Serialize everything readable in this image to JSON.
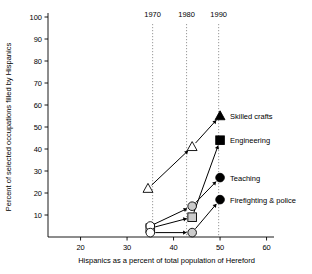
{
  "chart_data": {
    "type": "line",
    "title": "",
    "xlabel": "Hispanics as a percent of total population of Hereford",
    "ylabel": "Percent of selected occupations filled by Hispanics",
    "xlim": [
      13,
      62
    ],
    "ylim": [
      0,
      100
    ],
    "xticks": [
      20,
      30,
      40,
      50,
      60
    ],
    "xtick_labels": [
      "20",
      "30",
      "40",
      "50",
      "60"
    ],
    "yticks": [
      10,
      20,
      30,
      40,
      50,
      60,
      70,
      80,
      90,
      100
    ],
    "ytick_labels": [
      "10",
      "20",
      "30",
      "40",
      "50",
      "60",
      "70",
      "80",
      "90",
      "100"
    ],
    "grid": false,
    "legend_position": "inside-right",
    "year_markers": [
      {
        "label": "1970",
        "x": 35.5
      },
      {
        "label": "1980",
        "x": 42.8
      },
      {
        "label": "1990",
        "x": 49.7
      }
    ],
    "series": [
      {
        "name": "Skilled crafts",
        "marker": "triangle",
        "x": [
          34.5,
          44.0,
          50.0
        ],
        "values": [
          22,
          41,
          55
        ],
        "marker_fill": [
          "open",
          "open",
          "solid"
        ]
      },
      {
        "name": "Engineering",
        "marker": "square",
        "x": [
          35.0,
          44.0,
          50.0
        ],
        "values": [
          4,
          9,
          44
        ],
        "marker_fill": [
          "open",
          "grey",
          "solid"
        ]
      },
      {
        "name": "Teaching",
        "marker": "circle",
        "x": [
          35.0,
          44.0,
          50.0
        ],
        "values": [
          5,
          14,
          27
        ],
        "marker_fill": [
          "open",
          "grey",
          "solid"
        ]
      },
      {
        "name": "Firefighting & police",
        "marker": "circle",
        "x": [
          35.0,
          44.0,
          50.0
        ],
        "values": [
          2,
          2,
          17
        ],
        "marker_fill": [
          "open",
          "grey",
          "solid"
        ]
      }
    ],
    "legend_entries": [
      {
        "label": "Skilled crafts",
        "marker": "triangle",
        "x": 50.0,
        "y": 55
      },
      {
        "label": "Engineering",
        "marker": "square",
        "x": 50.0,
        "y": 44
      },
      {
        "label": "Teaching",
        "marker": "circle",
        "x": 50.0,
        "y": 27
      },
      {
        "label": "Firefighting & police",
        "marker": "circle",
        "x": 50.0,
        "y": 17
      }
    ]
  },
  "axes": {
    "x_title": "Hispanics as a percent of total population of Hereford",
    "y_title": "Percent of selected occupations filled by Hispanics",
    "x_ticks": [
      "20",
      "30",
      "40",
      "50",
      "60"
    ],
    "y_ticks": [
      "100",
      "90",
      "80",
      "70",
      "60",
      "50",
      "40",
      "30",
      "20",
      "10"
    ]
  },
  "years": [
    "1970",
    "1980",
    "1990"
  ],
  "legend": [
    "Skilled crafts",
    "Engineering",
    "Teaching",
    "Firefighting & police"
  ],
  "colors": {
    "axis": "#000000",
    "line": "#000000",
    "guide": "#808080",
    "marker_open": "#ffffff",
    "marker_grey": "#cccccc",
    "marker_solid": "#000000"
  }
}
